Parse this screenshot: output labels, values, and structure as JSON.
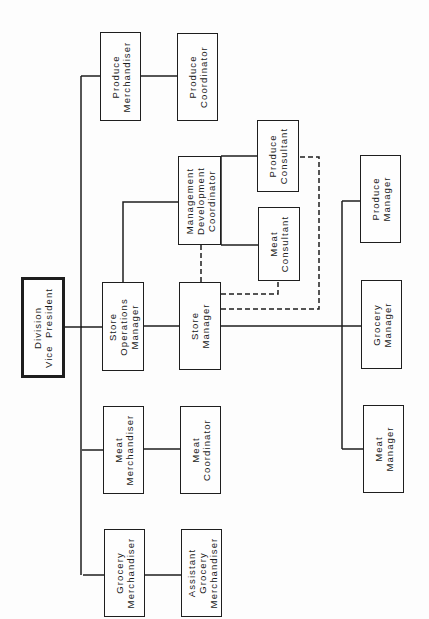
{
  "diagram": {
    "type": "org-chart",
    "orientation": "rotated-90-ccw",
    "colors": {
      "line": "#1e1e1e",
      "background": "#fdfdfd",
      "box_fill": "#fefefe"
    },
    "boxes": [
      {
        "id": "division-vice-president",
        "lines": [
          "Division",
          "Vice  President"
        ],
        "x": 21,
        "y": 277,
        "w": 44,
        "h": 101,
        "thick": true
      },
      {
        "id": "produce-merchandiser",
        "lines": [
          "Produce",
          "Merchandiser"
        ],
        "x": 100,
        "y": 32,
        "w": 41,
        "h": 89
      },
      {
        "id": "produce-coordinator",
        "lines": [
          "Produce",
          "Coordinator"
        ],
        "x": 177,
        "y": 33,
        "w": 41,
        "h": 88
      },
      {
        "id": "store-operations-manager",
        "lines": [
          "Store",
          "Operations",
          "Manager"
        ],
        "x": 102,
        "y": 282,
        "w": 42,
        "h": 89
      },
      {
        "id": "store-manager",
        "lines": [
          "Store",
          "Manager"
        ],
        "x": 179,
        "y": 282,
        "w": 42,
        "h": 88
      },
      {
        "id": "meat-merchandiser",
        "lines": [
          "Meat",
          "Merchandiser"
        ],
        "x": 103,
        "y": 406,
        "w": 41,
        "h": 88
      },
      {
        "id": "meat-coordinator",
        "lines": [
          "Meat",
          "Coordinator"
        ],
        "x": 180,
        "y": 406,
        "w": 41,
        "h": 88
      },
      {
        "id": "grocery-merchandiser",
        "lines": [
          "Grocery",
          "Merchandiser"
        ],
        "x": 104,
        "y": 529,
        "w": 41,
        "h": 88
      },
      {
        "id": "assistant-grocery-merchandiser",
        "lines": [
          "Assistant",
          "Grocery",
          "Merchandiser"
        ],
        "x": 181,
        "y": 529,
        "w": 41,
        "h": 88
      },
      {
        "id": "management-development-coordinator",
        "lines": [
          "Management",
          "Development",
          "Coordinator"
        ],
        "x": 178,
        "y": 156,
        "w": 43,
        "h": 89
      },
      {
        "id": "produce-consultant",
        "lines": [
          "Produce",
          "Consultant"
        ],
        "x": 257,
        "y": 120,
        "w": 42,
        "h": 72
      },
      {
        "id": "meat-consultant",
        "lines": [
          "Meat",
          "Consultant"
        ],
        "x": 258,
        "y": 207,
        "w": 42,
        "h": 74
      },
      {
        "id": "produce-manager",
        "lines": [
          "Produce",
          "Manager"
        ],
        "x": 360,
        "y": 155,
        "w": 41,
        "h": 88
      },
      {
        "id": "grocery-manager",
        "lines": [
          "Grocery",
          "Manager"
        ],
        "x": 361,
        "y": 280,
        "w": 41,
        "h": 89
      },
      {
        "id": "meat-manager",
        "lines": [
          "Meat",
          "Manager"
        ],
        "x": 363,
        "y": 405,
        "w": 41,
        "h": 88
      }
    ],
    "solid_lines": [
      {
        "name": "vp-to-trunk",
        "d": "M65 327 H82"
      },
      {
        "name": "merchandiser-trunk",
        "d": "M81 76 V575"
      },
      {
        "name": "trunk-to-produce-merchandiser",
        "d": "M81 76 H100"
      },
      {
        "name": "trunk-to-store-operations",
        "d": "M81 327 H102"
      },
      {
        "name": "trunk-to-meat-merchandiser",
        "d": "M82 450 H103"
      },
      {
        "name": "trunk-to-grocery-merchandiser",
        "d": "M83 575 H104"
      },
      {
        "name": "produce-merchandiser-to-coordinator",
        "d": "M141 76 H177"
      },
      {
        "name": "store-operations-to-store-manager",
        "d": "M144 326 H179"
      },
      {
        "name": "meat-merchandiser-to-coordinator",
        "d": "M144 449 H180"
      },
      {
        "name": "grocery-merchandiser-to-assistant",
        "d": "M145 575 H181"
      },
      {
        "name": "store-operations-to-mdc",
        "d": "M123 282 V202 H178"
      },
      {
        "name": "mdc-to-produce-consultant",
        "d": "M221 156 H257"
      },
      {
        "name": "mdc-consultant-bus",
        "d": "M221 156 V245"
      },
      {
        "name": "mdc-to-meat-consultant",
        "d": "M221 245 H258"
      },
      {
        "name": "store-manager-to-dept-bus",
        "d": "M221 326 H361"
      },
      {
        "name": "department-manager-bus",
        "d": "M342 201 V449"
      },
      {
        "name": "bus-to-produce-manager",
        "d": "M342 201 H360"
      },
      {
        "name": "bus-to-meat-manager",
        "d": "M342 449 H363"
      }
    ],
    "dashed_lines": [
      {
        "name": "store-manager-to-mdc-dashed",
        "d": "M201 245 V282"
      },
      {
        "name": "store-manager-to-meat-consultant-dashed",
        "d": "M221 294 H278 V281"
      },
      {
        "name": "store-manager-to-produce-consultant-dashed",
        "d": "M221 309 H319 V157 H299"
      }
    ]
  }
}
